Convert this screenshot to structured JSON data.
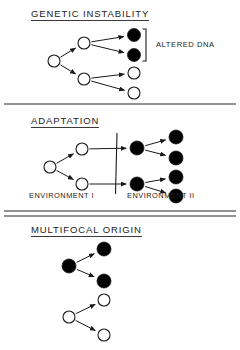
{
  "figure": {
    "background_color": "#ffffff",
    "stroke_color": "#1a1a1a",
    "filled_node_color": "#000000",
    "open_node_color": "#ffffff",
    "panels": [
      {
        "id": "genetic-instability",
        "title": "GENETIC  INSTABILITY",
        "annotation": "ALTERED DNA"
      },
      {
        "id": "adaptation",
        "title": "ADAPTATION",
        "left_label": "ENVIRONMENT I",
        "right_label": "ENVIRONMENT II"
      },
      {
        "id": "multifocal-origin",
        "title": "MULTIFOCAL  ORIGIN"
      }
    ]
  },
  "chart_data": {
    "type": "diagram",
    "nodes_legend": {
      "open_circle": "unaltered cell",
      "filled_circle": "altered cell"
    },
    "panels": [
      {
        "name": "GENETIC  INSTABILITY",
        "nodes": [
          {
            "id": "g0",
            "x": 54,
            "y": 61,
            "fill": "open",
            "r": 6
          },
          {
            "id": "g1",
            "x": 84,
            "y": 43,
            "fill": "open",
            "r": 6
          },
          {
            "id": "g2",
            "x": 84,
            "y": 79,
            "fill": "open",
            "r": 6
          },
          {
            "id": "g3",
            "x": 134,
            "y": 35,
            "fill": "filled",
            "r": 6.5
          },
          {
            "id": "g4",
            "x": 134,
            "y": 55,
            "fill": "filled",
            "r": 6.5
          },
          {
            "id": "g5",
            "x": 134,
            "y": 73,
            "fill": "open",
            "r": 6
          },
          {
            "id": "g6",
            "x": 134,
            "y": 93,
            "fill": "open",
            "r": 6
          }
        ],
        "edges": [
          [
            "g0",
            "g1"
          ],
          [
            "g0",
            "g2"
          ],
          [
            "g1",
            "g3"
          ],
          [
            "g1",
            "g4"
          ],
          [
            "g2",
            "g5"
          ],
          [
            "g2",
            "g6"
          ]
        ],
        "bracket": {
          "x": 146,
          "y_top": 29,
          "y_bottom": 61,
          "label": "ALTERED DNA"
        }
      },
      {
        "name": "ADAPTATION",
        "nodes": [
          {
            "id": "a0",
            "x": 50,
            "y": 167,
            "fill": "open",
            "r": 6
          },
          {
            "id": "a1",
            "x": 82,
            "y": 149,
            "fill": "open",
            "r": 6
          },
          {
            "id": "a2",
            "x": 82,
            "y": 184,
            "fill": "open",
            "r": 6
          },
          {
            "id": "a3",
            "x": 137,
            "y": 148,
            "fill": "filled",
            "r": 7
          },
          {
            "id": "a4",
            "x": 137,
            "y": 184,
            "fill": "filled",
            "r": 7
          },
          {
            "id": "a5",
            "x": 176,
            "y": 137,
            "fill": "filled",
            "r": 7
          },
          {
            "id": "a6",
            "x": 176,
            "y": 158,
            "fill": "filled",
            "r": 7
          },
          {
            "id": "a7",
            "x": 176,
            "y": 177,
            "fill": "filled",
            "r": 7
          },
          {
            "id": "a8",
            "x": 176,
            "y": 196,
            "fill": "filled",
            "r": 7
          }
        ],
        "edges": [
          [
            "a0",
            "a1"
          ],
          [
            "a0",
            "a2"
          ],
          [
            "a1",
            "a3"
          ],
          [
            "a2",
            "a4"
          ],
          [
            "a3",
            "a5"
          ],
          [
            "a3",
            "a6"
          ],
          [
            "a4",
            "a7"
          ],
          [
            "a4",
            "a8"
          ]
        ],
        "divider_line": {
          "x": 117,
          "y_top": 133,
          "y_bottom": 194
        },
        "labels": [
          {
            "text": "ENVIRONMENT I",
            "x": 30,
            "y": 196
          },
          {
            "text": "ENVIRONMENT II",
            "x": 128,
            "y": 196
          }
        ]
      },
      {
        "name": "MULTIFOCAL  ORIGIN",
        "nodes": [
          {
            "id": "m0",
            "x": 69,
            "y": 266,
            "fill": "filled",
            "r": 7
          },
          {
            "id": "m1",
            "x": 104,
            "y": 249,
            "fill": "filled",
            "r": 7
          },
          {
            "id": "m2",
            "x": 104,
            "y": 281,
            "fill": "filled",
            "r": 7
          },
          {
            "id": "m3",
            "x": 69,
            "y": 317,
            "fill": "open",
            "r": 6
          },
          {
            "id": "m4",
            "x": 104,
            "y": 300,
            "fill": "open",
            "r": 6
          },
          {
            "id": "m5",
            "x": 104,
            "y": 335,
            "fill": "open",
            "r": 6
          }
        ],
        "edges": [
          [
            "m0",
            "m1"
          ],
          [
            "m0",
            "m2"
          ],
          [
            "m3",
            "m4"
          ],
          [
            "m3",
            "m5"
          ]
        ]
      }
    ],
    "dividers": [
      {
        "y": 104,
        "weight": 1.6
      },
      {
        "y": 211,
        "weight": 1.4
      },
      {
        "y": 216,
        "weight": 1.4
      }
    ]
  }
}
